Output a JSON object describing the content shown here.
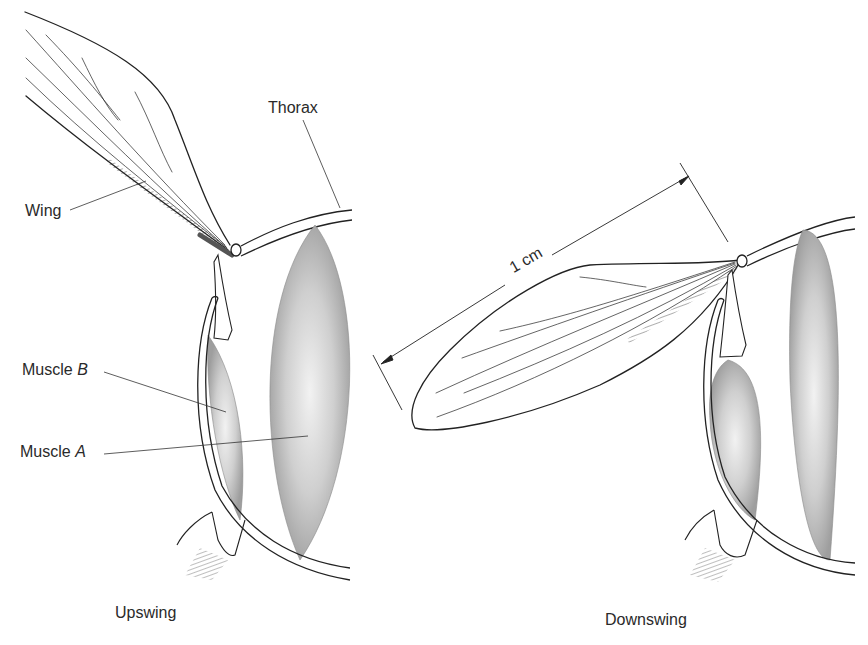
{
  "figure": {
    "panels": [
      {
        "id": "upswing",
        "caption": "Upswing"
      },
      {
        "id": "downswing",
        "caption": "Downswing"
      }
    ],
    "labels": {
      "thorax": "Thorax",
      "wing": "Wing",
      "muscle_b_prefix": "Muscle ",
      "muscle_b_letter": "B",
      "muscle_a_prefix": "Muscle ",
      "muscle_a_letter": "A"
    },
    "scale_bar": {
      "label": "1 cm"
    },
    "colors": {
      "ink": "#222222",
      "muscle_fill": "#a9a9a9",
      "muscle_highlight": "#e6e6e6",
      "background": "#ffffff"
    }
  }
}
